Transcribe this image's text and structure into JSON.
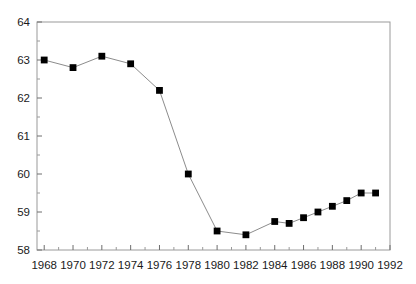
{
  "chart_data": {
    "type": "line",
    "title": "",
    "subtitle": "",
    "xlabel": "",
    "ylabel": "",
    "xlim": [
      1967.5,
      1992.0
    ],
    "ylim": [
      58,
      64
    ],
    "grid": false,
    "legend": null,
    "marker": "filled-square",
    "x": [
      1968,
      1969,
      1970,
      1971,
      1972,
      1973,
      1974,
      1975,
      1976,
      1977,
      1978,
      1979,
      1980,
      1981,
      1982,
      1983,
      1984,
      1985,
      1986,
      1987,
      1988,
      1989,
      1990,
      1991
    ],
    "series": [
      {
        "name": "value",
        "x": [
          1968,
          1970,
          1972,
          1974,
          1976,
          1978,
          1980,
          1982,
          1984,
          1985,
          1986,
          1987,
          1988,
          1989,
          1990,
          1991
        ],
        "values": [
          63.0,
          62.8,
          63.1,
          62.9,
          62.2,
          60.0,
          58.5,
          58.4,
          58.75,
          58.7,
          58.85,
          59.0,
          59.15,
          59.3,
          59.5,
          59.5
        ]
      }
    ],
    "y_ticks_major": [
      58,
      59,
      60,
      61,
      62,
      63,
      64
    ],
    "y_ticks_major_labels": [
      "58",
      "59",
      "60",
      "61",
      "62",
      "63",
      "64"
    ],
    "y_ticks_minor": [
      58.5,
      59.5,
      60.5,
      61.5,
      62.5,
      63.5
    ],
    "x_ticks_major": [
      1968,
      1970,
      1972,
      1974,
      1976,
      1978,
      1980,
      1982,
      1984,
      1986,
      1988,
      1990,
      1992
    ],
    "x_ticks_major_labels": [
      "1968",
      "1970",
      "1972",
      "1974",
      "1976",
      "1978",
      "1980",
      "1982",
      "1984",
      "1986",
      "1988",
      "1990",
      "1992"
    ],
    "x_ticks_minor": [
      1969,
      1971,
      1973,
      1975,
      1977,
      1979,
      1981,
      1983,
      1985,
      1987,
      1989,
      1991
    ],
    "colors": {
      "marker": "#000000",
      "line": "#8c8c8c",
      "axis": "#9a9a9a",
      "tick": "#6e6e6e",
      "text": "#1a1a1a",
      "background": "#ffffff"
    },
    "plot_area": {
      "left": 37,
      "right": 390,
      "top": 22,
      "bottom": 250
    }
  }
}
